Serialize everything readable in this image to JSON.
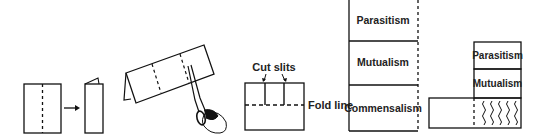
{
  "diagram": {
    "steps": [
      {
        "id": "step-1",
        "description": "Sheet with center dashed fold"
      },
      {
        "id": "step-2",
        "description": "Fold sheet in half"
      },
      {
        "id": "step-3",
        "description": "Cut along dashed lines with scissors"
      },
      {
        "id": "step-4",
        "description": "Cut slits to fold line",
        "labels": {
          "cut_slits": "Cut slits",
          "fold_line": "Fold line"
        }
      },
      {
        "id": "step-5",
        "description": "Flap booklet labeled",
        "flaps": [
          "Parasitism",
          "Mutualism",
          "Commensalism"
        ]
      },
      {
        "id": "step-6",
        "description": "Folded booklet with one flap lifted",
        "flaps": [
          "Parasitism",
          "Mutualism"
        ]
      }
    ],
    "labels": {
      "cut_slits": "Cut slits",
      "fold_line": "Fold line",
      "parasitism": "Parasitism",
      "mutualism": "Mutualism",
      "commensalism": "Commensalism"
    },
    "icons": [
      "arrow-right-icon",
      "scissors-icon",
      "hand-icon"
    ],
    "colors": {
      "line": "#111111",
      "background": "#ffffff"
    }
  }
}
